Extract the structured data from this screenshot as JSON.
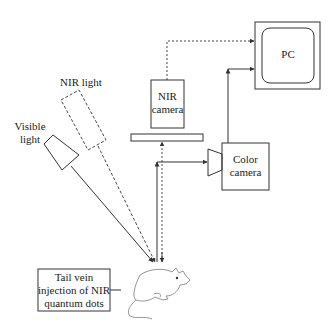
{
  "diagram": {
    "labels": {
      "nir_light": "NIR light",
      "visible_light_1": "Visible",
      "visible_light_2": "light",
      "nir_camera_1": "NIR",
      "nir_camera_2": "camera",
      "color_camera_1": "Color",
      "color_camera_2": "camera",
      "pc": "PC",
      "injection_1": "Tail vein",
      "injection_2": "injection of NIR",
      "injection_3": "quantum dots"
    },
    "colors": {
      "stroke": "#333333",
      "mouse": "#888888",
      "background": "#ffffff"
    }
  }
}
